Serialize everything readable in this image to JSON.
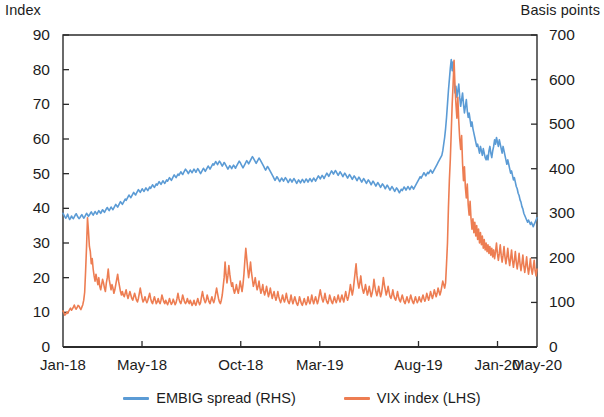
{
  "chart_data": {
    "type": "line",
    "title": "",
    "subtitle": "",
    "xlabel": "",
    "ylabel": "Index",
    "ylabel_right": "Basis points",
    "grid": false,
    "legend_position": "bottom",
    "ylim": [
      0,
      90
    ],
    "ylim_right": [
      0,
      700
    ],
    "yticks": [
      0,
      10,
      20,
      30,
      40,
      50,
      60,
      70,
      80,
      90
    ],
    "yticks_right": [
      0,
      100,
      200,
      300,
      400,
      500,
      600,
      700
    ],
    "xtick_labels": [
      "Jan-18",
      "May-18",
      "Oct-18",
      "Mar-19",
      "Aug-19",
      "Jan-20",
      "May-20"
    ],
    "xtick_positions": [
      0,
      0.1667,
      0.375,
      0.5417,
      0.75,
      0.9167,
      1.0
    ],
    "x_range": [
      "Jan-18",
      "May-20"
    ],
    "series": [
      {
        "name": "EMBIG spread (RHS)",
        "axis": "right",
        "color": "#5b9bd5",
        "unit": "basis points",
        "values": [
          300,
          296,
          292,
          289,
          293,
          298,
          291,
          286,
          289,
          294,
          290,
          288,
          292,
          296,
          299,
          295,
          291,
          288,
          290,
          294,
          297,
          293,
          289,
          292,
          296,
          300,
          297,
          293,
          296,
          300,
          303,
          299,
          296,
          300,
          304,
          301,
          298,
          302,
          306,
          303,
          300,
          304,
          308,
          305,
          302,
          306,
          310,
          313,
          309,
          306,
          310,
          314,
          311,
          308,
          312,
          316,
          320,
          317,
          314,
          318,
          322,
          326,
          323,
          320,
          324,
          328,
          332,
          329,
          333,
          337,
          341,
          338,
          335,
          339,
          343,
          347,
          344,
          341,
          345,
          349,
          353,
          350,
          347,
          351,
          355,
          352,
          349,
          353,
          357,
          354,
          351,
          355,
          359,
          356,
          360,
          364,
          361,
          358,
          362,
          366,
          363,
          367,
          371,
          368,
          365,
          369,
          373,
          370,
          367,
          371,
          375,
          372,
          376,
          380,
          377,
          374,
          378,
          382,
          386,
          383,
          380,
          384,
          388,
          385,
          389,
          393,
          390,
          387,
          391,
          395,
          399,
          396,
          393,
          389,
          393,
          397,
          394,
          391,
          395,
          399,
          396,
          392,
          396,
          400,
          397,
          393,
          389,
          393,
          397,
          401,
          398,
          394,
          398,
          402,
          406,
          403,
          399,
          403,
          407,
          411,
          408,
          412,
          416,
          413,
          409,
          413,
          417,
          414,
          410,
          406,
          410,
          414,
          411,
          407,
          403,
          399,
          403,
          407,
          404,
          400,
          404,
          408,
          405,
          401,
          405,
          409,
          413,
          417,
          414,
          410,
          406,
          402,
          406,
          410,
          414,
          418,
          415,
          411,
          415,
          419,
          423,
          427,
          424,
          420,
          416,
          412,
          416,
          420,
          424,
          421,
          417,
          413,
          409,
          405,
          401,
          397,
          401,
          405,
          402,
          398,
          394,
          390,
          386,
          382,
          378,
          374,
          378,
          382,
          379,
          375,
          371,
          375,
          379,
          376,
          372,
          376,
          380,
          377,
          373,
          369,
          373,
          377,
          374,
          370,
          374,
          378,
          375,
          371,
          367,
          371,
          375,
          372,
          368,
          372,
          376,
          373,
          369,
          373,
          377,
          374,
          370,
          374,
          378,
          375,
          371,
          375,
          379,
          376,
          372,
          376,
          380,
          384,
          381,
          377,
          381,
          385,
          382,
          378,
          382,
          386,
          390,
          387,
          383,
          387,
          391,
          395,
          392,
          388,
          392,
          396,
          393,
          389,
          385,
          389,
          393,
          390,
          386,
          382,
          386,
          390,
          387,
          383,
          379,
          383,
          387,
          384,
          380,
          376,
          380,
          384,
          381,
          377,
          373,
          377,
          381,
          378,
          374,
          370,
          374,
          378,
          375,
          371,
          367,
          371,
          375,
          372,
          368,
          364,
          368,
          372,
          369,
          365,
          361,
          365,
          369,
          366,
          362,
          358,
          362,
          366,
          363,
          359,
          355,
          359,
          363,
          360,
          356,
          352,
          356,
          360,
          357,
          353,
          349,
          353,
          357,
          354,
          350,
          346,
          350,
          354,
          351,
          355,
          359,
          356,
          352,
          356,
          360,
          357,
          353,
          357,
          361,
          358,
          354,
          358,
          362,
          366,
          370,
          374,
          378,
          382,
          379,
          383,
          387,
          391,
          388,
          384,
          388,
          392,
          389,
          393,
          397,
          394,
          390,
          394,
          398,
          402,
          406,
          410,
          414,
          418,
          422,
          426,
          430,
          440,
          455,
          470,
          490,
          515,
          545,
          575,
          600,
          625,
          645,
          620,
          640,
          600,
          570,
          585,
          560,
          575,
          590,
          560,
          540,
          555,
          570,
          545,
          525,
          540,
          555,
          530,
          515,
          525,
          510,
          495,
          505,
          490,
          480,
          470,
          460,
          450,
          455,
          445,
          435,
          450,
          440,
          430,
          445,
          435,
          425,
          420,
          430,
          420,
          440,
          450,
          435,
          425,
          440,
          450,
          465,
          455,
          470,
          460,
          450,
          465,
          455,
          445,
          435,
          450,
          440,
          430,
          420,
          410,
          420,
          410,
          400,
          390,
          395,
          385,
          375,
          380,
          370,
          360,
          355,
          345,
          340,
          330,
          325,
          315,
          310,
          300,
          295,
          290,
          285,
          280,
          285,
          280,
          275,
          280,
          275,
          270,
          275,
          280,
          285,
          290
        ]
      },
      {
        "name": "VIX index (LHS)",
        "axis": "left",
        "color": "#ed7d52",
        "unit": "index",
        "values": [
          10.4,
          9.8,
          9.2,
          9.5,
          10.1,
          9.7,
          10.3,
          10.8,
          11.2,
          10.6,
          11.0,
          11.5,
          12.1,
          11.3,
          10.9,
          11.4,
          12.0,
          11.8,
          11.2,
          10.8,
          11.5,
          12.2,
          13.5,
          15.8,
          22.0,
          29.0,
          37.3,
          33.5,
          29.0,
          27.5,
          24.0,
          25.5,
          22.5,
          20.5,
          19.0,
          21.0,
          19.5,
          18.0,
          20.0,
          17.5,
          16.5,
          18.0,
          19.5,
          18.5,
          17.0,
          16.0,
          18.5,
          20.0,
          22.5,
          19.5,
          18.0,
          16.5,
          18.0,
          17.0,
          15.5,
          16.5,
          18.0,
          19.5,
          21.0,
          19.0,
          17.5,
          16.0,
          15.0,
          16.0,
          15.0,
          14.5,
          15.5,
          16.5,
          15.0,
          14.0,
          15.0,
          16.0,
          15.0,
          14.0,
          13.5,
          14.5,
          15.5,
          14.5,
          13.5,
          13.0,
          14.0,
          15.5,
          17.0,
          15.5,
          14.0,
          13.0,
          13.5,
          14.5,
          13.5,
          12.8,
          13.5,
          14.5,
          15.5,
          14.0,
          13.0,
          12.5,
          13.5,
          14.5,
          13.5,
          12.5,
          13.0,
          14.0,
          13.0,
          12.5,
          13.5,
          15.0,
          14.0,
          13.0,
          12.5,
          13.5,
          12.8,
          12.2,
          13.0,
          14.0,
          13.0,
          12.3,
          12.8,
          13.8,
          13.0,
          12.2,
          12.8,
          14.0,
          15.5,
          14.0,
          13.0,
          12.5,
          13.5,
          15.0,
          14.0,
          13.0,
          12.5,
          13.0,
          14.0,
          13.0,
          12.5,
          13.5,
          12.8,
          12.0,
          12.5,
          13.5,
          12.5,
          12.0,
          13.0,
          14.0,
          13.0,
          12.2,
          12.8,
          14.5,
          16.0,
          14.5,
          13.5,
          12.8,
          13.5,
          15.0,
          14.0,
          13.0,
          12.5,
          13.5,
          14.5,
          13.5,
          12.8,
          13.8,
          15.5,
          17.0,
          15.5,
          14.0,
          13.0,
          12.5,
          13.5,
          15.0,
          17.5,
          20.0,
          24.5,
          21.0,
          18.5,
          20.5,
          23.5,
          21.0,
          19.0,
          17.5,
          18.5,
          16.5,
          15.5,
          16.5,
          18.0,
          16.5,
          15.5,
          17.0,
          19.0,
          17.5,
          16.0,
          18.0,
          21.0,
          25.0,
          28.5,
          25.5,
          22.5,
          20.0,
          22.0,
          24.5,
          21.5,
          19.5,
          17.5,
          18.5,
          20.0,
          18.0,
          16.5,
          17.5,
          19.0,
          17.0,
          15.5,
          16.5,
          18.0,
          16.0,
          15.0,
          16.0,
          17.5,
          16.0,
          14.5,
          15.5,
          17.0,
          15.5,
          14.0,
          15.0,
          16.0,
          14.5,
          13.5,
          14.5,
          16.0,
          14.5,
          13.5,
          12.8,
          13.8,
          15.0,
          13.8,
          13.0,
          14.0,
          15.5,
          14.0,
          13.0,
          12.5,
          13.5,
          15.0,
          13.5,
          12.5,
          13.5,
          14.5,
          13.5,
          12.5,
          12.0,
          13.0,
          14.5,
          13.5,
          12.5,
          12.0,
          13.0,
          14.0,
          13.0,
          12.2,
          13.0,
          14.5,
          13.2,
          12.5,
          13.5,
          15.0,
          13.5,
          12.5,
          13.5,
          14.5,
          13.5,
          12.5,
          13.5,
          15.0,
          16.5,
          15.0,
          13.8,
          13.0,
          14.0,
          15.5,
          14.0,
          13.0,
          12.5,
          13.5,
          15.0,
          14.0,
          13.0,
          12.5,
          13.5,
          14.5,
          13.5,
          12.8,
          13.8,
          15.0,
          13.8,
          13.0,
          14.0,
          15.0,
          13.8,
          13.0,
          14.5,
          16.0,
          14.5,
          13.5,
          14.5,
          16.0,
          18.0,
          16.5,
          15.0,
          16.5,
          19.0,
          21.5,
          24.0,
          20.5,
          18.5,
          17.0,
          18.5,
          20.5,
          18.0,
          16.5,
          15.5,
          16.5,
          18.0,
          16.5,
          15.0,
          16.0,
          17.5,
          16.0,
          14.5,
          15.5,
          17.0,
          19.5,
          17.5,
          16.0,
          14.8,
          15.8,
          17.5,
          16.0,
          14.5,
          15.5,
          17.5,
          20.0,
          18.0,
          16.5,
          15.0,
          16.0,
          17.5,
          16.0,
          14.5,
          14.0,
          15.0,
          16.5,
          15.0,
          14.0,
          13.5,
          14.5,
          16.0,
          14.5,
          13.5,
          13.0,
          14.0,
          15.0,
          14.0,
          13.0,
          12.5,
          13.5,
          14.5,
          13.5,
          12.8,
          13.8,
          15.0,
          14.0,
          13.0,
          12.5,
          13.5,
          14.5,
          13.5,
          12.8,
          13.5,
          14.5,
          13.5,
          13.0,
          14.0,
          15.0,
          14.0,
          13.2,
          14.0,
          15.5,
          14.5,
          13.5,
          14.5,
          16.0,
          15.0,
          14.0,
          15.0,
          16.5,
          15.5,
          14.5,
          15.5,
          17.0,
          16.0,
          15.0,
          16.0,
          17.5,
          19.0,
          18.0,
          17.0,
          18.5,
          24.0,
          30.0,
          40.0,
          48.0,
          54.0,
          62.0,
          70.0,
          76.0,
          82.7,
          75.0,
          70.0,
          66.0,
          72.0,
          65.0,
          60.0,
          57.0,
          61.0,
          53.0,
          48.0,
          52.0,
          46.0,
          43.0,
          47.0,
          41.0,
          38.0,
          42.0,
          37.0,
          34.0,
          37.0,
          33.0,
          36.0,
          32.0,
          35.0,
          31.0,
          34.0,
          30.0,
          33.0,
          29.5,
          32.0,
          28.5,
          31.0,
          28.0,
          30.0,
          27.5,
          29.5,
          27.0,
          29.0,
          26.5,
          28.5,
          26.0,
          28.0,
          25.5,
          27.5,
          30.0,
          27.0,
          25.0,
          27.0,
          29.5,
          26.5,
          24.5,
          26.5,
          29.0,
          26.0,
          24.0,
          26.0,
          28.5,
          25.5,
          23.5,
          25.5,
          28.0,
          25.0,
          23.0,
          25.0,
          27.5,
          24.5,
          22.5,
          24.5,
          27.0,
          24.0,
          22.0,
          24.0,
          26.5,
          23.5,
          21.5,
          23.5,
          26.0,
          23.0,
          21.0,
          23.0,
          25.5,
          22.5,
          21.0,
          23.0,
          25.0,
          22.0,
          20.5,
          22.5
        ]
      }
    ]
  },
  "legend": {
    "items": [
      {
        "label": "EMBIG spread (RHS)",
        "color": "#5b9bd5"
      },
      {
        "label": "VIX index (LHS)",
        "color": "#ed7d52"
      }
    ]
  }
}
